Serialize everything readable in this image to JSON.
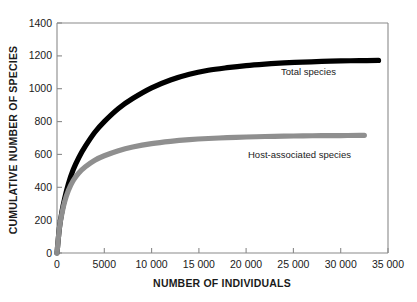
{
  "chart_data": {
    "type": "line",
    "title": "",
    "xlabel": "NUMBER OF INDIVIDUALS",
    "ylabel": "CUMULATIVE NUMBER OF SPECIES",
    "xlim": [
      0,
      35000
    ],
    "ylim": [
      0,
      1400
    ],
    "xticks": [
      0,
      5000,
      10000,
      15000,
      20000,
      25000,
      30000,
      35000
    ],
    "xtick_labels": [
      "0",
      "5000",
      "10 000",
      "15 000",
      "20 000",
      "25 000",
      "30 000",
      "35 000"
    ],
    "yticks": [
      0,
      200,
      400,
      600,
      800,
      1000,
      1200,
      1400
    ],
    "ytick_labels": [
      "0",
      "200",
      "400",
      "600",
      "800",
      "1000",
      "1200",
      "1400"
    ],
    "grid": false,
    "legend_position": "inline-annotation",
    "series": [
      {
        "name": "Total species",
        "color": "#000000",
        "annotation": "Total species",
        "x": [
          0,
          250,
          500,
          800,
          1200,
          1700,
          2300,
          3000,
          4000,
          5000,
          6500,
          8000,
          10000,
          12000,
          14000,
          16000,
          18000,
          20000,
          22000,
          24000,
          26000,
          28000,
          30000,
          32000,
          34000
        ],
        "y": [
          0,
          150,
          245,
          330,
          420,
          505,
          580,
          650,
          735,
          800,
          880,
          940,
          1005,
          1053,
          1088,
          1112,
          1128,
          1141,
          1150,
          1157,
          1162,
          1166,
          1169,
          1171,
          1172
        ]
      },
      {
        "name": "Host-associated species",
        "color": "#8f8f8f",
        "annotation": "Host-associated species",
        "x": [
          0,
          250,
          500,
          800,
          1200,
          1700,
          2300,
          3000,
          4000,
          5000,
          6500,
          8000,
          10000,
          12000,
          14000,
          16000,
          18000,
          20000,
          22000,
          24000,
          26000,
          28000,
          30000,
          32000,
          32500
        ],
        "y": [
          0,
          150,
          235,
          310,
          380,
          440,
          487,
          525,
          565,
          592,
          623,
          645,
          666,
          680,
          690,
          697,
          702,
          706,
          709,
          711,
          713,
          714,
          715,
          716,
          716
        ]
      }
    ],
    "annotations": [
      {
        "text": "Total species",
        "x": 24000,
        "y": 1080
      },
      {
        "text": "Host-associated species",
        "x": 21500,
        "y": 630
      }
    ]
  }
}
